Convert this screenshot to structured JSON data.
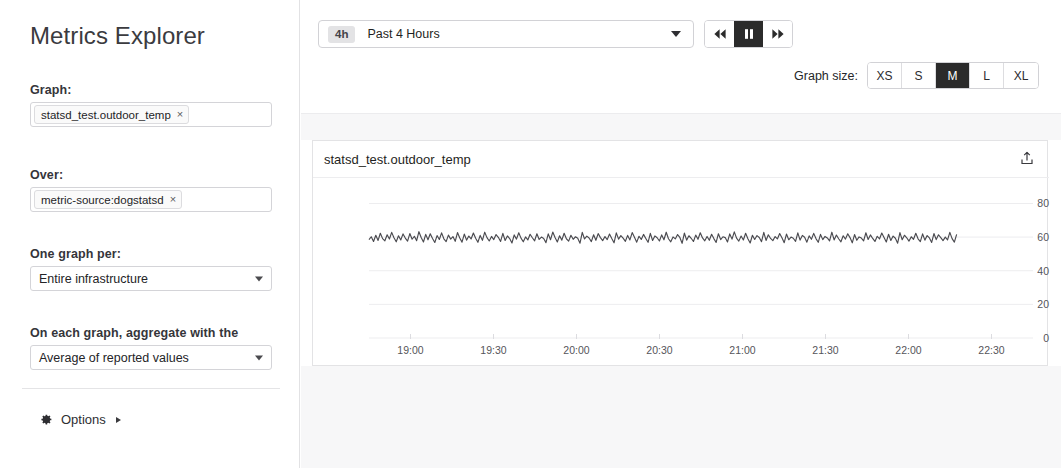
{
  "sidebar": {
    "title": "Metrics Explorer",
    "fields": [
      {
        "label": "Graph:",
        "type": "tag",
        "tag": "statsd_test.outdoor_temp",
        "remove": "×"
      },
      {
        "label": "Over:",
        "type": "tag",
        "tag": "metric-source:dogstatsd",
        "remove": "×"
      },
      {
        "label": "One graph per:",
        "type": "select",
        "value": "Entire infrastructure"
      },
      {
        "label": "On each graph, aggregate with the",
        "type": "select",
        "value": "Average of reported values"
      }
    ],
    "options_label": "Options",
    "options_icon": "gear-icon"
  },
  "toolbar": {
    "time_badge": "4h",
    "time_label": "Past 4 Hours",
    "playback": [
      {
        "name": "rewind",
        "icon": "rewind-icon",
        "selected": false
      },
      {
        "name": "pause",
        "icon": "pause-icon",
        "selected": true
      },
      {
        "name": "fast-forward",
        "icon": "fast-forward-icon",
        "selected": false
      }
    ],
    "graph_size_label": "Graph size:",
    "graph_sizes": [
      {
        "label": "XS",
        "selected": false
      },
      {
        "label": "S",
        "selected": false
      },
      {
        "label": "M",
        "selected": true
      },
      {
        "label": "L",
        "selected": false
      },
      {
        "label": "XL",
        "selected": false
      }
    ]
  },
  "chart": {
    "title": "statsd_test.outdoor_temp",
    "export_icon": "export-icon"
  },
  "colors": {
    "selected_bg": "#2b2b2b",
    "line": "#4a4a4f",
    "grid": "#ededef",
    "band": "#f7f7f8",
    "border": "#d2d2d6"
  },
  "chart_data": {
    "type": "line",
    "title": "statsd_test.outdoor_temp",
    "xlabel": "",
    "ylabel": "",
    "ylim": [
      0,
      88
    ],
    "yticks": [
      0,
      20,
      40,
      60,
      80
    ],
    "xticks": [
      "19:00",
      "19:30",
      "20:00",
      "20:30",
      "21:00",
      "21:30",
      "22:00",
      "22:30"
    ],
    "grid": true,
    "legend": false,
    "series": [
      {
        "name": "statsd_test.outdoor_temp",
        "color": "#4a4a4f",
        "data_end_fraction": 0.885,
        "values": [
          58.5,
          60.2,
          57.4,
          61.1,
          58.0,
          62.3,
          59.1,
          57.8,
          61.4,
          58.9,
          62.8,
          59.6,
          57.2,
          60.8,
          58.3,
          61.9,
          59.4,
          57.6,
          62.1,
          58.7,
          60.5,
          57.9,
          63.2,
          59.8,
          57.1,
          61.6,
          58.4,
          62.0,
          59.2,
          56.8,
          60.9,
          58.6,
          62.5,
          59.0,
          57.3,
          61.2,
          58.8,
          60.3,
          57.5,
          62.7,
          59.5,
          57.0,
          61.8,
          58.2,
          60.6,
          58.9,
          62.4,
          59.3,
          56.9,
          61.0,
          58.1,
          62.9,
          59.7,
          57.7,
          60.4,
          58.5,
          61.5,
          59.9,
          57.4,
          62.2,
          58.0,
          60.7,
          59.1,
          56.5,
          61.3,
          58.8,
          62.6,
          59.4,
          57.2,
          60.1,
          58.3,
          61.7,
          59.6,
          57.8,
          62.0,
          58.6,
          60.0,
          59.2,
          56.7,
          61.9,
          58.4,
          63.0,
          59.8,
          57.1,
          60.8,
          58.2,
          62.3,
          59.0,
          57.6,
          61.1,
          58.7,
          60.2,
          59.3,
          56.4,
          62.8,
          58.9,
          60.6,
          59.5,
          57.3,
          61.4,
          58.1,
          62.1,
          59.7,
          57.9,
          60.3,
          58.5,
          61.8,
          59.1,
          56.6,
          62.5,
          58.8,
          60.9,
          59.4,
          57.5,
          61.0,
          58.3,
          62.7,
          59.9,
          57.0,
          60.5,
          58.6,
          61.6,
          59.2,
          56.9,
          62.2,
          58.0,
          60.7,
          59.6,
          57.7,
          61.3,
          58.4,
          62.9,
          59.0,
          57.2,
          60.1,
          58.9,
          61.5,
          59.8,
          56.3,
          62.4,
          58.2,
          60.8,
          59.3,
          57.4,
          61.2,
          58.7,
          62.6,
          59.5,
          57.8,
          60.4,
          58.1,
          61.7,
          59.1,
          56.8,
          62.0,
          58.5,
          60.2,
          59.7,
          57.1,
          61.9,
          58.8,
          63.1,
          59.4,
          57.6,
          60.6,
          58.3,
          62.3,
          59.0,
          56.5,
          61.1,
          58.6,
          60.9,
          59.8,
          57.3,
          62.8,
          58.0,
          61.4,
          59.2,
          57.9,
          60.3,
          58.9,
          62.1,
          59.6,
          56.7,
          61.8,
          58.4,
          60.0,
          59.3,
          57.5,
          62.5,
          58.2,
          61.0,
          59.9,
          57.0,
          60.7,
          58.7,
          62.2,
          59.1,
          56.9,
          61.6,
          58.5,
          60.4,
          59.5,
          57.7,
          62.9,
          58.3,
          61.2,
          59.0,
          57.2,
          60.8,
          58.8,
          62.0,
          59.7,
          56.6,
          61.5,
          58.1,
          60.1,
          59.4,
          57.8,
          62.6,
          58.6,
          61.3,
          59.2,
          57.4,
          60.5,
          58.9,
          62.4,
          59.8,
          57.1,
          61.7,
          58.0,
          60.6,
          59.3,
          56.4,
          62.7,
          58.4,
          61.1,
          59.6,
          57.6,
          60.2,
          58.7,
          62.3,
          59.0,
          57.3,
          61.9,
          58.2,
          60.9,
          59.5,
          56.8,
          62.1,
          58.5,
          61.4,
          59.7,
          57.9,
          60.0,
          58.3,
          62.8,
          59.1,
          57.0,
          61.6
        ]
      }
    ]
  }
}
